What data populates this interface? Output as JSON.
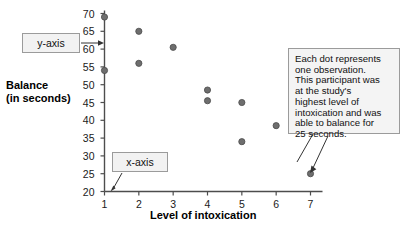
{
  "chart_data": {
    "type": "scatter",
    "title": "",
    "xlabel": "Level of intoxication",
    "ylabel": "Balance (in seconds)",
    "ylabel_line1": "Balance",
    "ylabel_line2": "(in seconds)",
    "xlim": [
      1,
      7
    ],
    "ylim": [
      20,
      70
    ],
    "xticks": [
      "1",
      "2",
      "3",
      "4",
      "5",
      "6",
      "7"
    ],
    "yticks": [
      "20",
      "25",
      "30",
      "35",
      "40",
      "45",
      "50",
      "55",
      "60",
      "65",
      "70"
    ],
    "grid": false,
    "legend": "none",
    "point_color": "#6e6e6e",
    "points": [
      {
        "x": 1,
        "y": 69
      },
      {
        "x": 1,
        "y": 54
      },
      {
        "x": 2,
        "y": 65
      },
      {
        "x": 2,
        "y": 56
      },
      {
        "x": 3,
        "y": 60.5
      },
      {
        "x": 4,
        "y": 48.5
      },
      {
        "x": 4,
        "y": 45.5
      },
      {
        "x": 5,
        "y": 45
      },
      {
        "x": 5,
        "y": 34
      },
      {
        "x": 6,
        "y": 38.5
      },
      {
        "x": 7,
        "y": 25
      }
    ]
  },
  "annotations": {
    "yaxis_label": "y-axis",
    "xaxis_label": "x-axis",
    "note_lines": [
      "Each dot represents",
      "one observation.",
      "This participant was",
      "at the study's",
      "highest level of",
      "intoxication and was",
      "able to balance for",
      "25 seconds."
    ]
  }
}
